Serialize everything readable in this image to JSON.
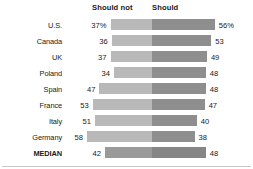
{
  "header": {
    "left_label": "Should not",
    "right_label": "Should"
  },
  "chart_data": {
    "type": "bar",
    "title": "",
    "subtitle": "",
    "xlabel": "",
    "ylabel": "",
    "orientation": "horizontal",
    "style": "diverging-stacked",
    "grid": false,
    "legend_position": "top",
    "axis_note": "Center split at fixed position; left segment extends leftward, right segment extends rightward",
    "categories": [
      "U.S.",
      "Canada",
      "UK",
      "Poland",
      "Spain",
      "France",
      "Italy",
      "Germany",
      "MEDIAN"
    ],
    "series": [
      {
        "name": "Should not",
        "color": "#b9b9b9",
        "values": [
          37,
          36,
          37,
          34,
          47,
          53,
          51,
          58,
          42
        ],
        "labels": [
          "37%",
          "36",
          "37",
          "34",
          "47",
          "53",
          "51",
          "58",
          "42"
        ]
      },
      {
        "name": "Should",
        "color": "#8e8e8e",
        "values": [
          56,
          53,
          49,
          48,
          48,
          47,
          40,
          38,
          48
        ],
        "labels": [
          "56%",
          "53",
          "49",
          "48",
          "48",
          "47",
          "40",
          "38",
          "48"
        ]
      }
    ],
    "rows": [
      {
        "label": "U.S.",
        "left": 37,
        "right": 56,
        "left_label": "37%",
        "right_label": "56%",
        "emphasis": false
      },
      {
        "label": "Canada",
        "left": 36,
        "right": 53,
        "left_label": "36",
        "right_label": "53",
        "emphasis": false
      },
      {
        "label": "UK",
        "left": 37,
        "right": 49,
        "left_label": "37",
        "right_label": "49",
        "emphasis": false
      },
      {
        "label": "Poland",
        "left": 34,
        "right": 48,
        "left_label": "34",
        "right_label": "48",
        "emphasis": false
      },
      {
        "label": "Spain",
        "left": 47,
        "right": 48,
        "left_label": "47",
        "right_label": "48",
        "emphasis": false
      },
      {
        "label": "France",
        "left": 53,
        "right": 47,
        "left_label": "53",
        "right_label": "47",
        "emphasis": false
      },
      {
        "label": "Italy",
        "left": 51,
        "right": 40,
        "left_label": "51",
        "right_label": "40",
        "emphasis": false
      },
      {
        "label": "Germany",
        "left": 58,
        "right": 38,
        "left_label": "58",
        "right_label": "38",
        "emphasis": false
      },
      {
        "label": "MEDIAN",
        "left": 42,
        "right": 48,
        "left_label": "42",
        "right_label": "48",
        "emphasis": true
      }
    ]
  },
  "layout": {
    "center_x": 152,
    "px_per_unit": 1.12,
    "row_height": 16,
    "rows_top": 17,
    "value_gap": 4
  },
  "colors": {
    "background": "#ffffff",
    "bar_left": "#b9b9b9",
    "bar_right": "#8e8e8e",
    "bar_left_median": "#9a9a9a",
    "bar_right_median": "#868686",
    "text": "#1a1a1a",
    "rule": "#c9c9c9"
  }
}
